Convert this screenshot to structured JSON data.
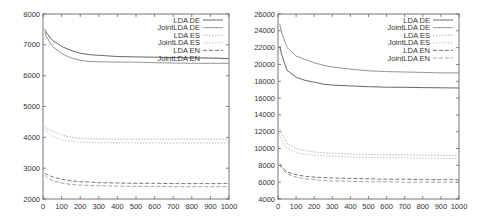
{
  "chart_data": [
    {
      "type": "line",
      "title": "",
      "xlabel": "",
      "ylabel": "",
      "xlim": [
        0,
        1000
      ],
      "ylim": [
        2000,
        8000
      ],
      "xticks": [
        0,
        100,
        200,
        300,
        400,
        500,
        600,
        700,
        800,
        900,
        1000
      ],
      "yticks": [
        2000,
        3000,
        4000,
        5000,
        6000,
        7000,
        8000
      ],
      "grid": false,
      "legend_position": "top-right",
      "x": [
        10,
        20,
        50,
        100,
        150,
        200,
        250,
        300,
        400,
        500,
        600,
        700,
        800,
        900,
        1000
      ],
      "series": [
        {
          "name": "LDA DE",
          "style": "solid",
          "color": "#555555",
          "values": [
            7500,
            7380,
            7150,
            6950,
            6820,
            6730,
            6680,
            6660,
            6620,
            6610,
            6600,
            6590,
            6580,
            6570,
            6550
          ]
        },
        {
          "name": "JointLDA DE",
          "style": "solid",
          "color": "#888888",
          "values": [
            7420,
            7250,
            6950,
            6720,
            6580,
            6500,
            6460,
            6450,
            6440,
            6440,
            6420,
            6410,
            6400,
            6400,
            6400
          ]
        },
        {
          "name": "LDA ES",
          "style": "dotted",
          "color": "#aaaaaa",
          "values": [
            4350,
            4300,
            4200,
            4080,
            4000,
            3970,
            3950,
            3950,
            3940,
            3940,
            3940,
            3940,
            3940,
            3940,
            3940
          ]
        },
        {
          "name": "JointLDA ES",
          "style": "dotted",
          "color": "#bbbbbb",
          "values": [
            4280,
            4200,
            4050,
            3920,
            3870,
            3850,
            3840,
            3830,
            3830,
            3820,
            3820,
            3820,
            3820,
            3820,
            3820
          ]
        },
        {
          "name": "LDA EN",
          "style": "dashed",
          "color": "#666666",
          "values": [
            2850,
            2800,
            2720,
            2640,
            2590,
            2560,
            2550,
            2530,
            2520,
            2510,
            2510,
            2500,
            2500,
            2500,
            2500
          ]
        },
        {
          "name": "JointLDA EN",
          "style": "dashed",
          "color": "#999999",
          "values": [
            2780,
            2700,
            2600,
            2520,
            2470,
            2450,
            2440,
            2430,
            2420,
            2410,
            2410,
            2400,
            2400,
            2400,
            2400
          ]
        }
      ]
    },
    {
      "type": "line",
      "title": "",
      "xlabel": "",
      "ylabel": "",
      "xlim": [
        0,
        1000
      ],
      "ylim": [
        4000,
        26000
      ],
      "xticks": [
        0,
        100,
        200,
        300,
        400,
        500,
        600,
        700,
        800,
        900,
        1000
      ],
      "yticks": [
        4000,
        6000,
        8000,
        10000,
        12000,
        14000,
        16000,
        18000,
        20000,
        22000,
        24000,
        26000
      ],
      "grid": false,
      "legend_position": "top-right",
      "x": [
        10,
        20,
        50,
        100,
        150,
        200,
        250,
        300,
        400,
        500,
        600,
        700,
        800,
        900,
        1000
      ],
      "series": [
        {
          "name": "LDA DE",
          "style": "solid",
          "color": "#555555",
          "values": [
            22200,
            21200,
            19300,
            18500,
            18100,
            17900,
            17650,
            17550,
            17450,
            17350,
            17300,
            17280,
            17250,
            17220,
            17200
          ]
        },
        {
          "name": "JointLDA DE",
          "style": "solid",
          "color": "#888888",
          "values": [
            24800,
            23800,
            22000,
            21000,
            20600,
            20200,
            19900,
            19700,
            19450,
            19250,
            19150,
            19100,
            19050,
            19000,
            19000
          ]
        },
        {
          "name": "LDA ES",
          "style": "dotted",
          "color": "#aaaaaa",
          "values": [
            12300,
            11800,
            10600,
            10000,
            9750,
            9600,
            9500,
            9450,
            9350,
            9300,
            9250,
            9250,
            9200,
            9200,
            9200
          ]
        },
        {
          "name": "JointLDA ES",
          "style": "dotted",
          "color": "#bbbbbb",
          "values": [
            11400,
            11000,
            10000,
            9500,
            9300,
            9200,
            9150,
            9100,
            9000,
            8950,
            8900,
            8900,
            8850,
            8850,
            8800
          ]
        },
        {
          "name": "LDA EN",
          "style": "dashed",
          "color": "#666666",
          "values": [
            8200,
            7900,
            7200,
            6900,
            6700,
            6600,
            6550,
            6500,
            6450,
            6400,
            6350,
            6350,
            6300,
            6300,
            6300
          ]
        },
        {
          "name": "JointLDA EN",
          "style": "dashed",
          "color": "#999999",
          "values": [
            8000,
            7700,
            7000,
            6600,
            6400,
            6300,
            6200,
            6150,
            6100,
            6050,
            6050,
            6000,
            6000,
            6000,
            6000
          ]
        }
      ]
    }
  ],
  "layout": [
    {
      "plot_left": 43,
      "plot_right": 229,
      "plot_top": 14,
      "plot_bottom": 199
    },
    {
      "plot_left": 34,
      "plot_right": 215,
      "plot_top": 14,
      "plot_bottom": 199
    }
  ]
}
